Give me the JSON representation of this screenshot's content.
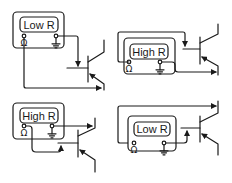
{
  "diagram": {
    "panels": [
      {
        "id": "top-left",
        "meter_label": "Low R",
        "terminal_left": "Ω",
        "terminal_right": "ground"
      },
      {
        "id": "top-right",
        "meter_label": "High R",
        "terminal_left": "Ω",
        "terminal_right": "ground"
      },
      {
        "id": "bottom-left",
        "meter_label": "High R",
        "terminal_left": "Ω",
        "terminal_right": "ground"
      },
      {
        "id": "bottom-right",
        "meter_label": "Low R",
        "terminal_left": "Ω",
        "terminal_right": "ground"
      }
    ],
    "symbols": {
      "ohm": "Ω"
    }
  }
}
